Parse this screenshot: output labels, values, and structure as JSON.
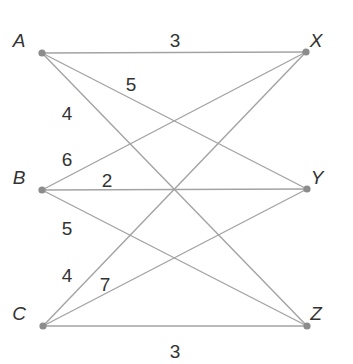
{
  "diagram": {
    "type": "bipartite-weighted-graph",
    "left_nodes": [
      "A",
      "B",
      "C"
    ],
    "right_nodes": [
      "X",
      "Y",
      "Z"
    ],
    "nodes": [
      {
        "id": "A",
        "label": "A",
        "x": 42,
        "y": 53,
        "lx": 19,
        "ly": 42
      },
      {
        "id": "B",
        "label": "B",
        "x": 42,
        "y": 190,
        "lx": 19,
        "ly": 179
      },
      {
        "id": "C",
        "label": "C",
        "x": 43,
        "y": 326,
        "lx": 19,
        "ly": 315
      },
      {
        "id": "X",
        "label": "X",
        "x": 306,
        "y": 52,
        "lx": 316,
        "ly": 42
      },
      {
        "id": "Y",
        "label": "Y",
        "x": 307,
        "y": 189,
        "lx": 317,
        "ly": 179
      },
      {
        "id": "Z",
        "label": "Z",
        "x": 307,
        "y": 326,
        "lx": 316,
        "ly": 315
      }
    ],
    "edges": [
      {
        "from": "A",
        "to": "X",
        "weight": "3",
        "wx": 175,
        "wy": 42
      },
      {
        "from": "A",
        "to": "Y",
        "weight": "5",
        "wx": 131,
        "wy": 86
      },
      {
        "from": "A",
        "to": "Z",
        "weight": "4",
        "wx": 67,
        "wy": 115
      },
      {
        "from": "B",
        "to": "X",
        "weight": "6",
        "wx": 67,
        "wy": 161
      },
      {
        "from": "B",
        "to": "Y",
        "weight": "2",
        "wx": 107,
        "wy": 182
      },
      {
        "from": "B",
        "to": "Z",
        "weight": "5",
        "wx": 67,
        "wy": 230
      },
      {
        "from": "C",
        "to": "X",
        "weight": "4",
        "wx": 67,
        "wy": 277
      },
      {
        "from": "C",
        "to": "Y",
        "weight": "7",
        "wx": 105,
        "wy": 286
      },
      {
        "from": "C",
        "to": "Z",
        "weight": "3",
        "wx": 175,
        "wy": 353
      }
    ]
  }
}
